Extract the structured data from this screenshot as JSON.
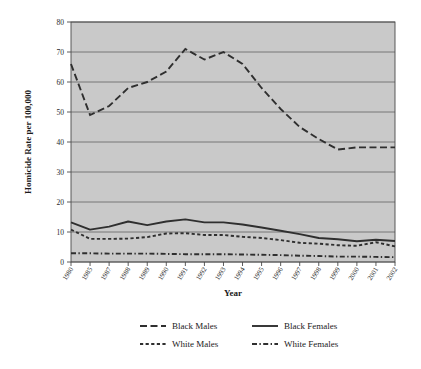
{
  "chart_data": {
    "type": "line",
    "title": "",
    "xlabel": "Year",
    "ylabel": "Homicide Rate per 100,000",
    "ylim": [
      0,
      80
    ],
    "ytick_step": 10,
    "yticks": [
      0,
      10,
      20,
      30,
      40,
      50,
      60,
      70,
      80
    ],
    "grid": true,
    "grid_axis": "y",
    "legend_position": "bottom",
    "plot_background": "#c9c9c9",
    "line_color": "#2f2f2f",
    "categories": [
      "1980",
      "1985",
      "1987",
      "1988",
      "1989",
      "1990",
      "1991",
      "1992",
      "1993",
      "1994",
      "1995",
      "1996",
      "1997",
      "1998",
      "1999",
      "2000",
      "2001",
      "2002"
    ],
    "series": [
      {
        "name": "Black Males",
        "dash": "long-dash",
        "values": [
          66.0,
          49.0,
          52.0,
          58.0,
          60.0,
          63.5,
          71.0,
          67.5,
          70.0,
          66.0,
          58.0,
          51.0,
          45.0,
          41.0,
          37.5,
          38.2,
          38.2,
          38.2
        ]
      },
      {
        "name": "Black Females",
        "dash": "solid",
        "values": [
          13.2,
          10.8,
          11.8,
          13.5,
          12.3,
          13.5,
          14.2,
          13.2,
          13.2,
          12.5,
          11.5,
          10.4,
          9.3,
          8.0,
          7.6,
          6.9,
          7.4,
          7.0
        ]
      },
      {
        "name": "White Males",
        "dash": "short-dash",
        "values": [
          10.8,
          7.7,
          7.7,
          7.8,
          8.3,
          9.5,
          9.6,
          9.0,
          9.0,
          8.4,
          8.0,
          7.3,
          6.4,
          6.1,
          5.6,
          5.4,
          6.6,
          5.2
        ]
      },
      {
        "name": "White Females",
        "dash": "dash-dot",
        "values": [
          2.9,
          2.9,
          2.8,
          2.8,
          2.8,
          2.7,
          2.6,
          2.6,
          2.6,
          2.5,
          2.4,
          2.3,
          2.1,
          2.0,
          1.8,
          1.8,
          1.7,
          1.6
        ]
      }
    ]
  },
  "legend": {
    "items": [
      {
        "label": "Black Males",
        "dash": "long-dash"
      },
      {
        "label": "Black Females",
        "dash": "solid"
      },
      {
        "label": "White Males",
        "dash": "short-dash"
      },
      {
        "label": "White Females",
        "dash": "dash-dot"
      }
    ]
  },
  "axes": {
    "x_title": "Year",
    "y_title": "Homicide Rate per 100,000"
  }
}
